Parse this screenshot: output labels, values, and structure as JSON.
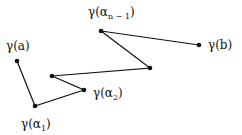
{
  "diagram": {
    "stroke_color": "#111111",
    "points": [
      {
        "id": "gamma_a",
        "x": 17,
        "y": 61
      },
      {
        "id": "gamma_alpha1",
        "x": 35,
        "y": 106
      },
      {
        "id": "gamma_alpha2",
        "x": 84,
        "y": 90
      },
      {
        "id": "p3",
        "x": 52,
        "y": 76
      },
      {
        "id": "p4",
        "x": 150,
        "y": 68
      },
      {
        "id": "gamma_alpha_n_minus_1",
        "x": 101,
        "y": 31
      },
      {
        "id": "gamma_b",
        "x": 199,
        "y": 45
      }
    ],
    "labels": {
      "gamma_a": {
        "main": "γ(a)"
      },
      "gamma_alpha1": {
        "prefix": "γ(α",
        "sub": "1",
        "suffix": ")"
      },
      "gamma_alpha2": {
        "prefix": "γ(α",
        "sub": "2",
        "suffix": ")"
      },
      "gamma_alpha_n_minus_1": {
        "prefix": "γ(α",
        "sub": "n − 1",
        "suffix": ")"
      },
      "gamma_b": {
        "main": "γ(b)"
      }
    }
  }
}
